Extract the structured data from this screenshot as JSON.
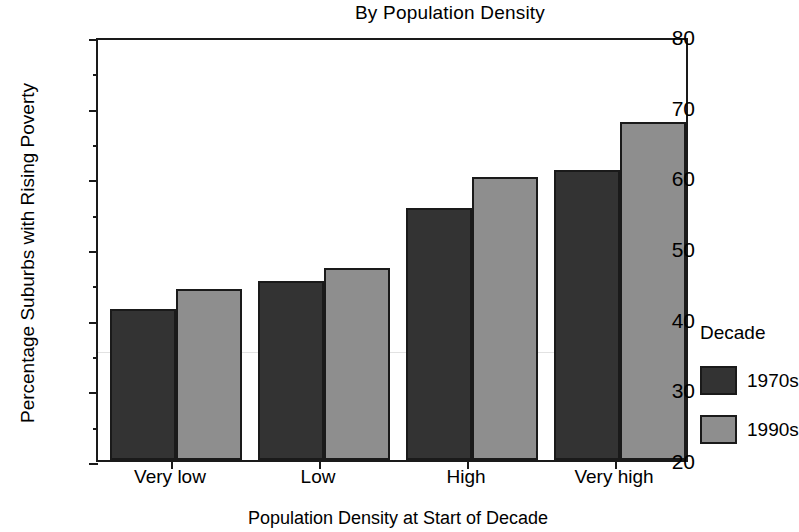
{
  "chart_data": {
    "type": "bar",
    "title": "By Population Density",
    "xlabel": "Population Density at Start of Decade",
    "ylabel": "Percentage Suburbs with Rising Poverty",
    "categories": [
      "Very low",
      "Low",
      "High",
      "Very high"
    ],
    "series": [
      {
        "name": "1970s",
        "color": "#333333",
        "values": [
          41.4,
          45.4,
          55.6,
          61.0
        ]
      },
      {
        "name": "1990s",
        "color": "#8e8e8e",
        "values": [
          44.2,
          47.2,
          60.0,
          67.8
        ]
      }
    ],
    "ylim": [
      20,
      80
    ],
    "ytick_labels": [
      "80",
      "70",
      "60",
      "50",
      "40",
      "30",
      "20"
    ],
    "ytick_values": [
      80,
      70,
      60,
      50,
      40,
      30,
      20
    ],
    "yminor_values": [
      75,
      65,
      55,
      45,
      35,
      25
    ],
    "grid": false,
    "legend": {
      "title": "Decade",
      "position": "right"
    }
  }
}
